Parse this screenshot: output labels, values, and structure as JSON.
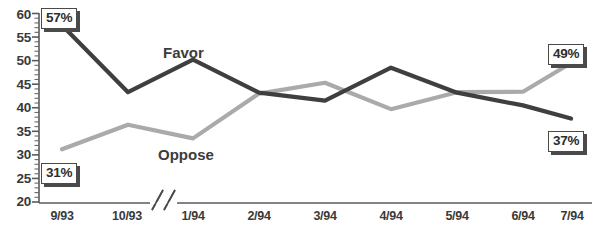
{
  "chart_data": {
    "type": "line",
    "title": "",
    "xlabel": "",
    "ylabel": "",
    "grid": false,
    "legend_position": "inline-labels",
    "categories": [
      "9/93",
      "10/93",
      "1/94",
      "2/94",
      "3/94",
      "4/94",
      "5/94",
      "6/94",
      "7/94"
    ],
    "axis_break_after_category": "10/93",
    "ylim": [
      20,
      60
    ],
    "ytick_step": 5,
    "yminor_step": 1,
    "ytick_labels": [
      "60",
      "55",
      "50",
      "45",
      "40",
      "35",
      "30",
      "25",
      "20"
    ],
    "ytick_values": [
      60,
      55,
      50,
      45,
      40,
      35,
      30,
      25,
      20
    ],
    "series": [
      {
        "name": "Favor",
        "color": "#3f3f3f",
        "values": [
          57.5,
          43.3,
          50.2,
          43.2,
          41.5,
          48.5,
          43.2,
          40.5,
          37.7
        ]
      },
      {
        "name": "Oppose",
        "color": "#aaaaaa",
        "values": [
          31.2,
          36.4,
          33.5,
          43.0,
          45.3,
          39.7,
          43.3,
          43.4,
          49.5
        ]
      }
    ],
    "annotations": [
      {
        "text": "57%",
        "series": "Favor",
        "category": "9/93",
        "value": 57.5
      },
      {
        "text": "31%",
        "series": "Oppose",
        "category": "9/93",
        "value": 31.2
      },
      {
        "text": "49%",
        "series": "Oppose",
        "category": "7/94",
        "value": 49.5
      },
      {
        "text": "37%",
        "series": "Favor",
        "category": "7/94",
        "value": 37.7
      }
    ],
    "inline_series_labels": [
      {
        "text": "Favor",
        "series": "Favor"
      },
      {
        "text": "Oppose",
        "series": "Oppose"
      }
    ]
  },
  "axis": {
    "color": "#5a5a5a"
  }
}
